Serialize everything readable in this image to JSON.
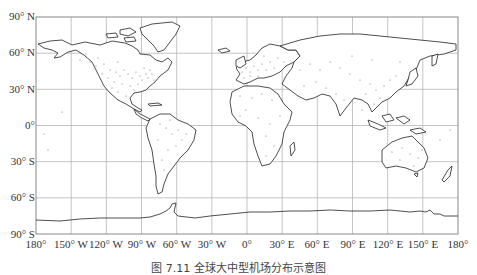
{
  "map": {
    "projection": "equirectangular",
    "frame": {
      "left": 36,
      "top": 17,
      "right": 458,
      "bottom": 234
    },
    "grid_step_degrees": 30,
    "colors": {
      "coastline": "#222222",
      "grid": "#b5b5b5",
      "frame": "#888888",
      "dots": "#555555",
      "background": "#ffffff"
    },
    "lat_labels": [
      "90° N",
      "60° N",
      "30° N",
      "0°",
      "30° S",
      "60° S",
      "90° S"
    ],
    "lon_labels": [
      "180°",
      "150° W",
      "120° W",
      "90° W",
      "60° W",
      "30° W",
      "0°",
      "30° E",
      "60° E",
      "90° E",
      "120° E",
      "150° E",
      "180°"
    ],
    "content": "World map showing distribution of airports as dots over continents",
    "caption": "图 7.11   全球大中型机场分布示意图"
  }
}
